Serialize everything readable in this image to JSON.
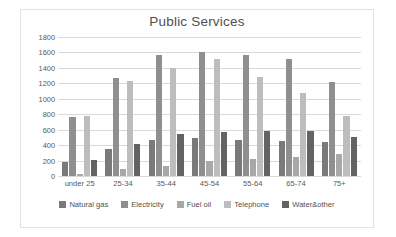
{
  "chart_data": {
    "type": "bar",
    "title": "Public Services",
    "xlabel": "",
    "ylabel": "",
    "ylim": [
      0,
      1800
    ],
    "ytick_step": 200,
    "yticks": [
      1800,
      1600,
      1400,
      1200,
      1000,
      800,
      600,
      400,
      200,
      0
    ],
    "grid": true,
    "legend_position": "bottom",
    "categories": [
      "under 25",
      "25-34",
      "35-44",
      "45-54",
      "55-64",
      "65-74",
      "75+"
    ],
    "series": [
      {
        "name": "Natural gas",
        "color": "#7a7a7a",
        "values": [
          180,
          350,
          460,
          495,
          470,
          450,
          445
        ]
      },
      {
        "name": "Electricity",
        "color": "#8f8f8f",
        "values": [
          760,
          1265,
          1570,
          1610,
          1570,
          1520,
          1220
        ]
      },
      {
        "name": "Fuel oil",
        "color": "#a8a8a8",
        "values": [
          30,
          85,
          130,
          195,
          215,
          250,
          285
        ]
      },
      {
        "name": "Telephone",
        "color": "#bdbdbd",
        "values": [
          775,
          1225,
          1405,
          1510,
          1285,
          1080,
          775
        ]
      },
      {
        "name": "Water&other",
        "color": "#636363",
        "values": [
          205,
          410,
          550,
          570,
          580,
          580,
          500
        ]
      }
    ]
  }
}
